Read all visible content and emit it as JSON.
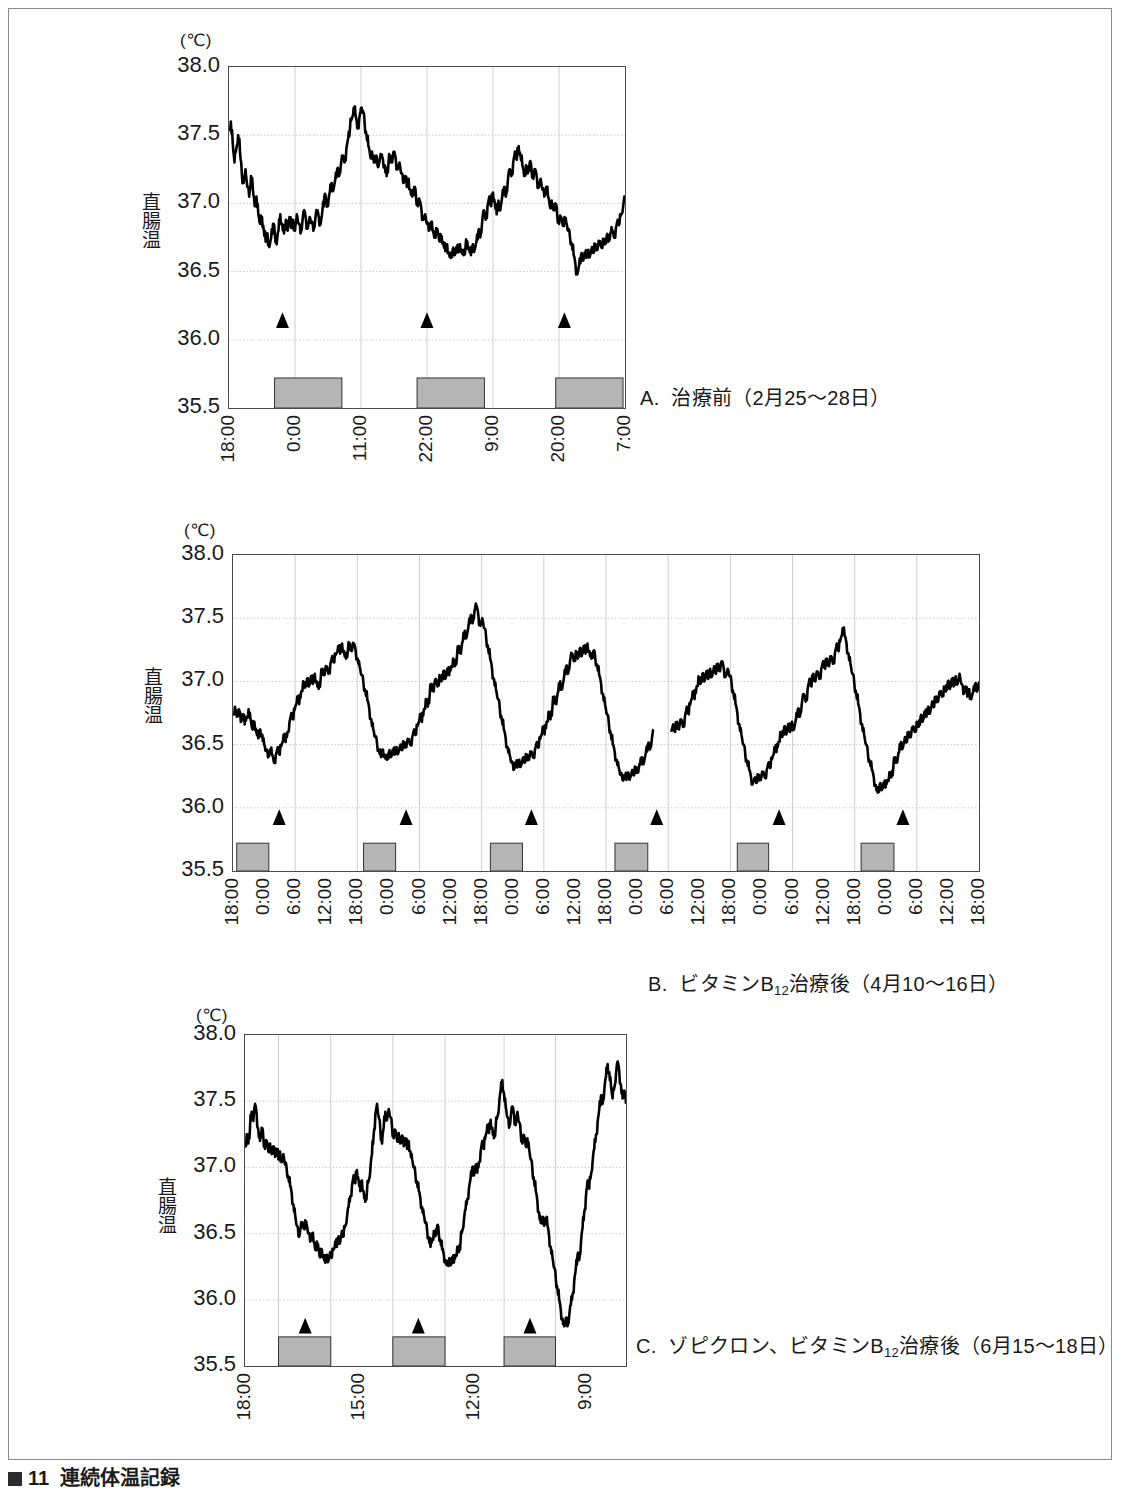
{
  "figure": {
    "label": "図",
    "number": "11",
    "title": "連続体温記録"
  },
  "axis": {
    "unit": "(℃)",
    "y_title_chars": [
      "直",
      "腸",
      "温"
    ],
    "y_ticks": [
      "38.0",
      "37.5",
      "37.0",
      "36.5",
      "36.0",
      "35.5"
    ]
  },
  "legend_symbols": {
    "triangle": "sleep-onset-marker",
    "gray_bar": "sleep-period-bar"
  },
  "panels": [
    {
      "id": "A",
      "caption_prefix": "A.",
      "caption_text": "治療前（2月25〜28日）",
      "x_ticks": [
        "18:00",
        "0:00",
        "11:00",
        "22:00",
        "9:00",
        "20:00",
        "7:00"
      ],
      "x_tick_positions": [
        0.0,
        0.1667,
        0.3333,
        0.5,
        0.6667,
        0.8333,
        1.0
      ],
      "sleep_bars": [
        {
          "start": 0.115,
          "end": 0.285
        },
        {
          "start": 0.475,
          "end": 0.645
        },
        {
          "start": 0.825,
          "end": 0.995
        }
      ],
      "markers": [
        0.135,
        0.5,
        0.847
      ],
      "marker_value": 36.12
    },
    {
      "id": "B",
      "caption_prefix": "B.",
      "caption_text": "ビタミンB12治療後（4月10〜16日）",
      "caption_main": "ビタミンB",
      "caption_sub": "12",
      "caption_tail": "治療後（4月10〜16日）",
      "x_ticks": [
        "18:00",
        "0:00",
        "6:00",
        "12:00",
        "18:00",
        "0:00",
        "6:00",
        "12:00",
        "18:00",
        "0:00",
        "6:00",
        "12:00",
        "18:00",
        "0:00",
        "6:00",
        "12:00",
        "18:00",
        "0:00",
        "6:00",
        "12:00",
        "18:00",
        "0:00",
        "6:00",
        "12:00",
        "18:00"
      ],
      "sleep_bars": [
        {
          "start": 0.005,
          "end": 0.048
        },
        {
          "start": 0.175,
          "end": 0.218
        },
        {
          "start": 0.345,
          "end": 0.388
        },
        {
          "start": 0.512,
          "end": 0.556
        },
        {
          "start": 0.676,
          "end": 0.718
        },
        {
          "start": 0.842,
          "end": 0.886
        }
      ],
      "markers": [
        0.062,
        0.232,
        0.4,
        0.568,
        0.732,
        0.898
      ],
      "marker_value": 35.9
    },
    {
      "id": "C",
      "caption_prefix": "C.",
      "caption_text": "ゾピクロン、ビタミンB12治療後（6月15〜18日）",
      "caption_main": "ゾピクロン、ビタミンB",
      "caption_sub": "12",
      "caption_tail": "治療後（6月15〜18日）",
      "x_ticks": [
        "18:00",
        "15:00",
        "12:00",
        "9:00"
      ],
      "x_tick_positions": [
        0.0,
        0.3,
        0.6,
        0.895
      ],
      "sleep_bars": [
        {
          "start": 0.088,
          "end": 0.225
        },
        {
          "start": 0.388,
          "end": 0.525
        },
        {
          "start": 0.68,
          "end": 0.815
        }
      ],
      "markers": [
        0.158,
        0.455,
        0.748
      ],
      "marker_value": 35.78
    }
  ],
  "chart_data": {
    "type": "line",
    "title": "連続体温記録",
    "ylabel": "直腸温",
    "yunit": "℃",
    "ylim": [
      35.5,
      38.0
    ],
    "ytick_step": 0.5,
    "grid": true,
    "legend_position": "none",
    "series": [
      {
        "name": "A. 治療前（2月25〜28日）",
        "panel": "A",
        "xlabel_times": [
          "18:00",
          "0:00",
          "11:00",
          "22:00",
          "9:00",
          "20:00",
          "7:00"
        ],
        "values": [
          37.55,
          37.6,
          37.45,
          37.3,
          37.4,
          37.5,
          37.38,
          37.22,
          37.15,
          37.25,
          37.12,
          37.05,
          37.2,
          37.1,
          36.98,
          37.05,
          36.92,
          36.85,
          36.9,
          36.8,
          36.72,
          36.78,
          36.68,
          36.75,
          36.85,
          36.78,
          36.7,
          36.8,
          36.92,
          36.85,
          36.78,
          36.88,
          36.8,
          36.9,
          36.82,
          36.88,
          36.8,
          36.92,
          36.85,
          36.78,
          36.86,
          36.95,
          36.88,
          36.82,
          36.9,
          36.86,
          36.8,
          36.88,
          36.95,
          36.9,
          36.85,
          36.95,
          37.05,
          37.02,
          36.98,
          37.08,
          37.15,
          37.1,
          37.18,
          37.25,
          37.2,
          37.28,
          37.35,
          37.3,
          37.4,
          37.48,
          37.55,
          37.62,
          37.7,
          37.65,
          37.55,
          37.62,
          37.7,
          37.68,
          37.58,
          37.5,
          37.42,
          37.35,
          37.38,
          37.3,
          37.35,
          37.28,
          37.3,
          37.35,
          37.32,
          37.28,
          37.2,
          37.3,
          37.35,
          37.3,
          37.38,
          37.32,
          37.25,
          37.3,
          37.22,
          37.15,
          37.2,
          37.12,
          37.18,
          37.1,
          37.05,
          37.12,
          37.05,
          36.98,
          37.02,
          36.95,
          36.88,
          36.92,
          36.85,
          36.8,
          36.86,
          36.8,
          36.75,
          36.82,
          36.78,
          36.72,
          36.76,
          36.7,
          36.65,
          36.7,
          36.64,
          36.6,
          36.66,
          36.62,
          36.68,
          36.64,
          36.7,
          36.66,
          36.62,
          36.68,
          36.72,
          36.66,
          36.62,
          36.7,
          36.66,
          36.72,
          36.8,
          36.75,
          36.85,
          36.95,
          36.88,
          36.98,
          37.05,
          36.98,
          37.08,
          37.0,
          36.92,
          37.02,
          36.95,
          37.05,
          37.12,
          37.05,
          37.15,
          37.25,
          37.2,
          37.3,
          37.38,
          37.32,
          37.42,
          37.35,
          37.28,
          37.2,
          37.28,
          37.22,
          37.3,
          37.25,
          37.18,
          37.25,
          37.18,
          37.12,
          37.18,
          37.1,
          37.05,
          37.12,
          37.05,
          36.98,
          37.02,
          36.95,
          37.0,
          36.92,
          36.85,
          36.9,
          36.84,
          36.9,
          36.86,
          36.8,
          36.75,
          36.7,
          36.62,
          36.55,
          36.48,
          36.55,
          36.62,
          36.58,
          36.64,
          36.6,
          36.66,
          36.62,
          36.68,
          36.64,
          36.7,
          36.66,
          36.72,
          36.68,
          36.74,
          36.7,
          36.76,
          36.72,
          36.78,
          36.8,
          36.75,
          36.82,
          36.88,
          36.85,
          36.92,
          36.98,
          37.05
        ]
      },
      {
        "name": "B. ビタミンB12治療後（4月10〜16日）",
        "panel": "B",
        "values": [
          36.75,
          36.8,
          36.72,
          36.78,
          36.68,
          36.74,
          36.66,
          36.72,
          36.78,
          36.7,
          36.62,
          36.68,
          36.6,
          36.55,
          36.62,
          36.58,
          36.5,
          36.45,
          36.4,
          36.46,
          36.42,
          36.36,
          36.42,
          36.48,
          36.42,
          36.5,
          36.58,
          36.52,
          36.6,
          36.68,
          36.75,
          36.7,
          36.8,
          36.88,
          36.82,
          36.92,
          37.0,
          36.95,
          37.02,
          36.96,
          37.04,
          36.98,
          37.06,
          37.0,
          36.94,
          37.02,
          37.1,
          37.05,
          37.12,
          37.06,
          37.14,
          37.2,
          37.15,
          37.22,
          37.28,
          37.22,
          37.3,
          37.24,
          37.18,
          37.25,
          37.3,
          37.24,
          37.3,
          37.24,
          37.18,
          37.12,
          37.05,
          36.98,
          36.92,
          36.85,
          36.78,
          36.7,
          36.62,
          36.56,
          36.5,
          36.45,
          36.4,
          36.46,
          36.42,
          36.38,
          36.44,
          36.4,
          36.46,
          36.42,
          36.48,
          36.44,
          36.5,
          36.46,
          36.52,
          36.48,
          36.54,
          36.5,
          36.56,
          36.62,
          36.58,
          36.66,
          36.74,
          36.68,
          36.78,
          36.86,
          36.8,
          36.9,
          36.98,
          36.92,
          37.02,
          36.96,
          37.05,
          37.0,
          37.08,
          37.02,
          37.1,
          37.05,
          37.12,
          37.18,
          37.12,
          37.2,
          37.28,
          37.22,
          37.32,
          37.4,
          37.35,
          37.45,
          37.52,
          37.46,
          37.56,
          37.6,
          37.52,
          37.44,
          37.5,
          37.42,
          37.34,
          37.26,
          37.18,
          37.1,
          37.02,
          36.94,
          36.86,
          36.78,
          36.7,
          36.62,
          36.55,
          36.48,
          36.42,
          36.36,
          36.3,
          36.36,
          36.32,
          36.38,
          36.34,
          36.4,
          36.36,
          36.42,
          36.38,
          36.44,
          36.4,
          36.46,
          36.52,
          36.48,
          36.56,
          36.64,
          36.58,
          36.68,
          36.76,
          36.7,
          36.8,
          36.88,
          36.82,
          36.92,
          37.0,
          36.94,
          37.04,
          37.12,
          37.06,
          37.16,
          37.22,
          37.16,
          37.24,
          37.18,
          37.26,
          37.2,
          37.28,
          37.22,
          37.3,
          37.24,
          37.18,
          37.24,
          37.18,
          37.12,
          37.05,
          36.98,
          36.9,
          36.82,
          36.74,
          36.66,
          36.58,
          36.5,
          36.44,
          36.38,
          36.32,
          36.26,
          36.22,
          36.26,
          36.22,
          36.28,
          36.24,
          36.3,
          36.26,
          36.32,
          36.28,
          36.34,
          36.4,
          36.36,
          36.44,
          36.5,
          36.46,
          36.54,
          36.62,
          null,
          null,
          null,
          null,
          null,
          null,
          null,
          null,
          36.6,
          36.66,
          36.6,
          36.68,
          36.62,
          36.7,
          36.64,
          36.72,
          36.8,
          36.74,
          36.84,
          36.92,
          36.86,
          36.96,
          37.04,
          36.98,
          37.06,
          37.0,
          37.08,
          37.02,
          37.1,
          37.04,
          37.12,
          37.06,
          37.14,
          37.08,
          37.16,
          37.1,
          37.04,
          37.1,
          37.04,
          36.98,
          36.9,
          36.82,
          36.74,
          36.66,
          36.58,
          36.5,
          36.42,
          36.36,
          36.3,
          36.24,
          36.2,
          36.24,
          36.2,
          36.26,
          36.22,
          36.28,
          36.24,
          36.3,
          36.36,
          36.32,
          36.4,
          36.48,
          36.44,
          36.52,
          36.6,
          36.56,
          36.64,
          36.58,
          36.66,
          36.6,
          36.68,
          36.62,
          36.7,
          36.78,
          36.72,
          36.82,
          36.9,
          36.84,
          36.94,
          37.02,
          36.96,
          37.06,
          37.0,
          37.08,
          37.02,
          37.1,
          37.16,
          37.1,
          37.18,
          37.12,
          37.2,
          37.14,
          37.22,
          37.3,
          37.24,
          37.34,
          37.42,
          37.36,
          37.3,
          37.22,
          37.14,
          37.06,
          36.98,
          36.9,
          36.82,
          36.74,
          36.66,
          36.58,
          36.5,
          36.42,
          36.36,
          36.3,
          36.24,
          36.18,
          36.12,
          36.18,
          36.14,
          36.2,
          36.16,
          36.22,
          36.28,
          36.24,
          36.32,
          36.4,
          36.36,
          36.44,
          36.52,
          36.48,
          36.56,
          36.52,
          36.6,
          36.56,
          36.64,
          36.6,
          36.68,
          36.64,
          36.72,
          36.68,
          36.76,
          36.72,
          36.8,
          36.76,
          36.84,
          36.8,
          36.88,
          36.84,
          36.92,
          36.88,
          36.96,
          36.92,
          37.0,
          36.94,
          37.02,
          36.96,
          37.04,
          36.98,
          37.06,
          36.98,
          36.9,
          36.96,
          36.88,
          36.94,
          36.86,
          36.92,
          36.98,
          36.92,
          37.0
        ]
      },
      {
        "name": "C. ゾピクロン、ビタミンB12治療後（6月15〜18日）",
        "panel": "C",
        "values": [
          37.15,
          37.25,
          37.18,
          37.3,
          37.42,
          37.35,
          37.48,
          37.4,
          37.28,
          37.2,
          37.3,
          37.22,
          37.14,
          37.2,
          37.12,
          37.18,
          37.1,
          37.16,
          37.08,
          37.14,
          37.06,
          37.12,
          37.04,
          37.1,
          37.02,
          36.98,
          36.92,
          36.86,
          36.8,
          36.72,
          36.64,
          36.56,
          36.48,
          36.52,
          36.58,
          36.54,
          36.6,
          36.56,
          36.5,
          36.44,
          36.5,
          36.44,
          36.38,
          36.44,
          36.38,
          36.32,
          36.38,
          36.32,
          36.28,
          36.34,
          36.3,
          36.36,
          36.32,
          36.38,
          36.44,
          36.4,
          36.48,
          36.44,
          36.52,
          36.48,
          36.56,
          36.62,
          36.7,
          36.78,
          36.86,
          36.94,
          36.88,
          36.98,
          36.9,
          36.82,
          36.9,
          36.82,
          36.74,
          36.82,
          36.9,
          36.98,
          37.1,
          37.25,
          37.4,
          37.48,
          37.38,
          37.28,
          37.18,
          37.3,
          37.42,
          37.36,
          37.44,
          37.38,
          37.3,
          37.22,
          37.28,
          37.2,
          37.26,
          37.18,
          37.24,
          37.16,
          37.22,
          37.14,
          37.2,
          37.12,
          37.06,
          37.0,
          36.94,
          36.88,
          36.82,
          36.76,
          36.7,
          36.64,
          36.58,
          36.52,
          36.46,
          36.4,
          36.46,
          36.52,
          36.48,
          36.56,
          36.5,
          36.44,
          36.38,
          36.34,
          36.3,
          36.26,
          36.3,
          36.26,
          36.32,
          36.28,
          36.34,
          36.4,
          36.36,
          36.44,
          36.52,
          36.6,
          36.68,
          36.76,
          36.84,
          36.92,
          37.0,
          36.94,
          37.02,
          36.96,
          37.04,
          37.12,
          37.2,
          37.14,
          37.24,
          37.32,
          37.26,
          37.36,
          37.3,
          37.22,
          37.3,
          37.38,
          37.46,
          37.58,
          37.66,
          37.56,
          37.46,
          37.38,
          37.3,
          37.38,
          37.46,
          37.4,
          37.32,
          37.42,
          37.34,
          37.26,
          37.18,
          37.24,
          37.16,
          37.22,
          37.14,
          37.06,
          36.98,
          36.9,
          36.82,
          36.74,
          36.66,
          36.58,
          36.62,
          36.56,
          36.62,
          36.56,
          36.48,
          36.4,
          36.32,
          36.24,
          36.16,
          36.08,
          36.0,
          35.92,
          35.86,
          35.8,
          35.86,
          35.8,
          35.88,
          35.96,
          36.04,
          36.14,
          36.24,
          36.34,
          36.3,
          36.42,
          36.54,
          36.66,
          36.78,
          36.9,
          36.84,
          36.94,
          37.04,
          37.14,
          37.24,
          37.34,
          37.44,
          37.54,
          37.48,
          37.58,
          37.68,
          37.78,
          37.72,
          37.62,
          37.52,
          37.6,
          37.7,
          37.8,
          37.72,
          37.62,
          37.52,
          37.58,
          37.48
        ]
      }
    ]
  }
}
